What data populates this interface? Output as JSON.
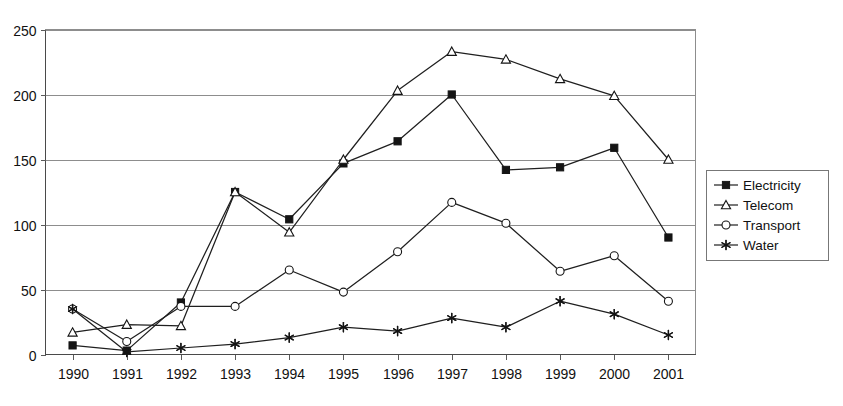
{
  "chart_data": {
    "type": "line",
    "title": "",
    "subtitle": "",
    "xlabel": "",
    "ylabel": "",
    "categories": [
      "1990",
      "1991",
      "1992",
      "1993",
      "1994",
      "1995",
      "1996",
      "1997",
      "1998",
      "1999",
      "2000",
      "2001"
    ],
    "ylim": [
      0,
      250
    ],
    "y_ticks": [
      0,
      50,
      100,
      150,
      200,
      250
    ],
    "y_tick_labels": [
      "0",
      "50",
      "100",
      "150",
      "200",
      "250"
    ],
    "grid": "horizontal",
    "legend_position": "right",
    "series": [
      {
        "name": "Electricity",
        "marker": "filled-square",
        "values": [
          7,
          3,
          40,
          125,
          104,
          147,
          164,
          200,
          142,
          144,
          159,
          90
        ]
      },
      {
        "name": "Telecom",
        "marker": "open-triangle",
        "values": [
          17,
          23,
          22,
          125,
          94,
          150,
          203,
          233,
          227,
          212,
          199,
          150
        ]
      },
      {
        "name": "Transport",
        "marker": "open-circle",
        "values": [
          35,
          10,
          37,
          37,
          65,
          48,
          79,
          117,
          101,
          64,
          76,
          41
        ]
      },
      {
        "name": "Water",
        "marker": "asterisk",
        "values": [
          35,
          2,
          5,
          8,
          13,
          21,
          18,
          28,
          21,
          41,
          31,
          15
        ]
      }
    ]
  },
  "legend": {
    "items": [
      {
        "label": "Electricity"
      },
      {
        "label": "Telecom"
      },
      {
        "label": "Transport"
      },
      {
        "label": "Water"
      }
    ]
  },
  "colors": {
    "ink": "#141414",
    "grid": "#8d8d8d",
    "background": "#ffffff"
  }
}
